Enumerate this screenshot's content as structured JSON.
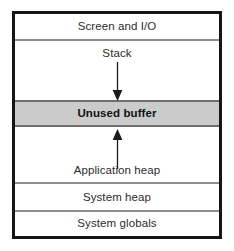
{
  "diagram": {
    "frame_color": "#151515",
    "divider_color": "#8d8d8d",
    "highlight_color": "#cbcbcb",
    "background_color": "#ffffff",
    "bands": [
      {
        "label": "Screen and I/O",
        "emphasis": "normal"
      },
      {
        "label": "Stack",
        "emphasis": "normal"
      },
      {
        "label": "Unused buffer",
        "emphasis": "bold"
      },
      {
        "label": "Application heap",
        "emphasis": "normal"
      },
      {
        "label": "System heap",
        "emphasis": "normal"
      },
      {
        "label": "System globals",
        "emphasis": "normal"
      }
    ],
    "arrows": [
      {
        "name": "stack-growth-arrow",
        "direction": "down"
      },
      {
        "name": "heap-growth-arrow",
        "direction": "up"
      }
    ]
  }
}
